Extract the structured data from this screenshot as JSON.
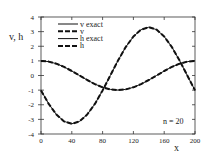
{
  "chart_data": {
    "type": "line",
    "title": "",
    "xlabel": "x",
    "ylabel": "v, h",
    "xlim": [
      0,
      200
    ],
    "ylim": [
      -4,
      4
    ],
    "xticks": [
      0,
      40,
      80,
      120,
      160,
      200
    ],
    "yticks": [
      4,
      3,
      2,
      1,
      0,
      -1,
      -2,
      -3,
      -4
    ],
    "grid": false,
    "legend_position": "upper right",
    "annotation": "n = 20",
    "x": [
      0,
      10,
      20,
      30,
      40,
      50,
      60,
      70,
      80,
      90,
      100,
      110,
      120,
      130,
      140,
      150,
      160,
      170,
      180,
      190,
      200
    ],
    "series": [
      {
        "name": "v exact",
        "style": "solid",
        "values": [
          -1.02,
          -1.94,
          -2.67,
          -3.14,
          -3.3,
          -3.14,
          -2.67,
          -1.94,
          -1.02,
          0.0,
          1.02,
          1.94,
          2.67,
          3.14,
          3.3,
          3.14,
          2.67,
          1.94,
          1.02,
          0.0,
          -1.02
        ]
      },
      {
        "name": "v",
        "style": "dashed",
        "values": [
          -1.02,
          -1.94,
          -2.67,
          -3.14,
          -3.3,
          -3.14,
          -2.67,
          -1.94,
          -1.02,
          0.0,
          1.02,
          1.94,
          2.67,
          3.14,
          3.3,
          3.14,
          2.67,
          1.94,
          1.02,
          0.0,
          -1.02
        ]
      },
      {
        "name": "h exact",
        "style": "solid",
        "values": [
          1.0,
          0.95,
          0.81,
          0.59,
          0.31,
          0.0,
          -0.31,
          -0.59,
          -0.81,
          -0.95,
          -1.0,
          -0.95,
          -0.81,
          -0.59,
          -0.31,
          0.0,
          0.31,
          0.59,
          0.81,
          0.95,
          1.0
        ]
      },
      {
        "name": "h",
        "style": "dashed",
        "values": [
          1.0,
          0.95,
          0.81,
          0.59,
          0.31,
          0.0,
          -0.31,
          -0.59,
          -0.81,
          -0.95,
          -1.0,
          -0.95,
          -0.81,
          -0.59,
          -0.31,
          0.0,
          0.31,
          0.59,
          0.81,
          0.95,
          1.0
        ]
      }
    ]
  }
}
